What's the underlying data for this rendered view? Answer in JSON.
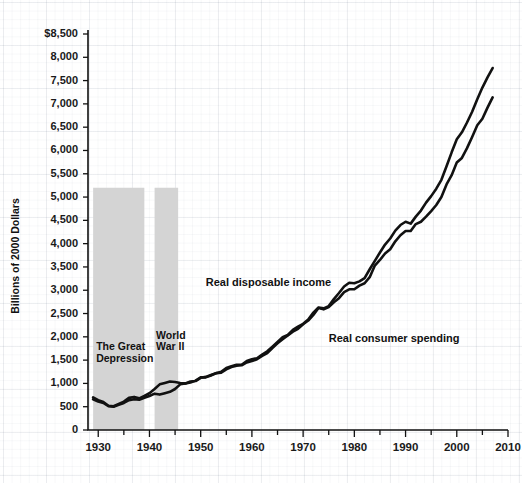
{
  "chart_data": {
    "type": "line",
    "title": "",
    "xlabel": "",
    "ylabel": "Billions of 2000 Dollars",
    "xlim": [
      1928,
      2010
    ],
    "ylim": [
      0,
      8800
    ],
    "ytick_labels": [
      "$8,500",
      "8,000",
      "7,500",
      "7,000",
      "6,500",
      "6,000",
      "5,500",
      "5,000",
      "4,500",
      "4,000",
      "3,500",
      "3,000",
      "2,500",
      "2,000",
      "1,500",
      "1,000",
      "500",
      "0"
    ],
    "yticks": [
      8500,
      8000,
      7500,
      7000,
      6500,
      6000,
      5500,
      5000,
      4500,
      4000,
      3500,
      3000,
      2500,
      2000,
      1500,
      1000,
      500,
      0
    ],
    "xtick_labels": [
      "1930",
      "1940",
      "1950",
      "1960",
      "1970",
      "1980",
      "1990",
      "2000",
      "2010"
    ],
    "xticks": [
      1930,
      1940,
      1950,
      1960,
      1970,
      1980,
      1990,
      2000,
      2010
    ],
    "xminor_step": 5,
    "grid": true,
    "legend_position": "inline-annotations",
    "annotations": [
      {
        "name": "the-great-depression",
        "text": "The Great\nDepression",
        "x_start": 1929,
        "x_end": 1939,
        "band_top": 5200
      },
      {
        "name": "world-war-ii",
        "text": "World\nWar II",
        "x_start": 1941,
        "x_end": 1945.6,
        "band_top": 5200
      }
    ],
    "band_color": "#d4d4d4",
    "line_color": "#111111",
    "series": [
      {
        "name": "Real disposable income",
        "label_x": 1951,
        "label_y": 3150,
        "x": [
          1929,
          1930,
          1931,
          1932,
          1933,
          1934,
          1935,
          1936,
          1937,
          1938,
          1939,
          1940,
          1941,
          1942,
          1943,
          1944,
          1945,
          1946,
          1947,
          1948,
          1949,
          1950,
          1951,
          1952,
          1953,
          1954,
          1955,
          1956,
          1957,
          1958,
          1959,
          1960,
          1961,
          1962,
          1963,
          1964,
          1965,
          1966,
          1967,
          1968,
          1969,
          1970,
          1971,
          1972,
          1973,
          1974,
          1975,
          1976,
          1977,
          1978,
          1979,
          1980,
          1981,
          1982,
          1983,
          1984,
          1985,
          1986,
          1987,
          1988,
          1989,
          1990,
          1991,
          1992,
          1993,
          1994,
          1995,
          1996,
          1997,
          1998,
          1999,
          2000,
          2001,
          2002,
          2003,
          2004,
          2005,
          2006,
          2007
        ],
        "values": [
          700,
          640,
          600,
          520,
          510,
          560,
          610,
          690,
          710,
          680,
          730,
          790,
          880,
          980,
          1010,
          1040,
          1030,
          1010,
          1000,
          1040,
          1050,
          1120,
          1140,
          1180,
          1220,
          1230,
          1300,
          1350,
          1380,
          1390,
          1450,
          1480,
          1520,
          1590,
          1650,
          1760,
          1860,
          1950,
          2030,
          2110,
          2170,
          2270,
          2350,
          2470,
          2620,
          2590,
          2640,
          2740,
          2830,
          2960,
          3020,
          3020,
          3100,
          3150,
          3280,
          3530,
          3650,
          3790,
          3880,
          4050,
          4180,
          4270,
          4270,
          4420,
          4470,
          4580,
          4700,
          4830,
          5000,
          5270,
          5470,
          5740,
          5840,
          6050,
          6290,
          6540,
          6680,
          6920,
          7140
        ]
      },
      {
        "name": "Real consumer spending",
        "label_x": 1975,
        "label_y": 1950,
        "x": [
          1929,
          1930,
          1931,
          1932,
          1933,
          1934,
          1935,
          1936,
          1937,
          1938,
          1939,
          1940,
          1941,
          1942,
          1943,
          1944,
          1945,
          1946,
          1947,
          1948,
          1949,
          1950,
          1951,
          1952,
          1953,
          1954,
          1955,
          1956,
          1957,
          1958,
          1959,
          1960,
          1961,
          1962,
          1963,
          1964,
          1965,
          1966,
          1967,
          1968,
          1969,
          1970,
          1971,
          1972,
          1973,
          1974,
          1975,
          1976,
          1977,
          1978,
          1979,
          1980,
          1981,
          1982,
          1983,
          1984,
          1985,
          1986,
          1987,
          1988,
          1989,
          1990,
          1991,
          1992,
          1993,
          1994,
          1995,
          1996,
          1997,
          1998,
          1999,
          2000,
          2001,
          2002,
          2003,
          2004,
          2005,
          2006,
          2007
        ],
        "values": [
          660,
          610,
          580,
          510,
          500,
          540,
          580,
          640,
          660,
          650,
          690,
          730,
          780,
          760,
          790,
          820,
          880,
          980,
          1000,
          1020,
          1060,
          1130,
          1130,
          1170,
          1220,
          1250,
          1330,
          1370,
          1400,
          1400,
          1480,
          1520,
          1540,
          1620,
          1690,
          1790,
          1890,
          1990,
          2040,
          2150,
          2220,
          2280,
          2370,
          2520,
          2630,
          2610,
          2660,
          2810,
          2940,
          3080,
          3160,
          3150,
          3190,
          3260,
          3450,
          3630,
          3810,
          3980,
          4110,
          4280,
          4400,
          4470,
          4430,
          4580,
          4710,
          4880,
          5020,
          5180,
          5370,
          5660,
          5960,
          6240,
          6390,
          6600,
          6830,
          7100,
          7350,
          7570,
          7770
        ]
      }
    ]
  }
}
